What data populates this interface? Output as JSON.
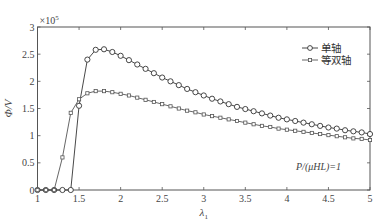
{
  "chart_data": {
    "type": "line",
    "title": "",
    "xlabel": "λ1",
    "ylabel": "Φ/V",
    "y_multiplier": "×10^5",
    "xlim": [
      1,
      5
    ],
    "ylim": [
      0,
      3
    ],
    "xticks": [
      1,
      1.5,
      2,
      2.5,
      3,
      3.5,
      4,
      4.5,
      5
    ],
    "yticks": [
      0,
      0.5,
      1,
      1.5,
      2,
      2.5,
      3
    ],
    "grid": false,
    "legend_position": "upper right",
    "annotation": "P/(μHL)=1",
    "x": [
      1.0,
      1.1,
      1.2,
      1.3,
      1.4,
      1.5,
      1.6,
      1.7,
      1.8,
      1.9,
      2.0,
      2.1,
      2.2,
      2.3,
      2.4,
      2.5,
      2.6,
      2.7,
      2.8,
      2.9,
      3.0,
      3.1,
      3.2,
      3.3,
      3.4,
      3.5,
      3.6,
      3.7,
      3.8,
      3.9,
      4.0,
      4.1,
      4.2,
      4.3,
      4.4,
      4.5,
      4.6,
      4.7,
      4.8,
      4.9,
      5.0
    ],
    "series": [
      {
        "name": "单轴",
        "marker": "circle",
        "values": [
          0,
          0,
          0,
          0,
          0,
          1.55,
          2.4,
          2.58,
          2.59,
          2.54,
          2.47,
          2.39,
          2.31,
          2.23,
          2.15,
          2.07,
          2.0,
          1.93,
          1.86,
          1.8,
          1.74,
          1.68,
          1.63,
          1.58,
          1.53,
          1.49,
          1.45,
          1.41,
          1.37,
          1.33,
          1.3,
          1.27,
          1.24,
          1.21,
          1.18,
          1.15,
          1.13,
          1.1,
          1.08,
          1.06,
          1.03
        ]
      },
      {
        "name": "等双轴",
        "marker": "square",
        "values": [
          0,
          0,
          0,
          0.6,
          1.42,
          1.67,
          1.78,
          1.82,
          1.82,
          1.8,
          1.77,
          1.74,
          1.7,
          1.66,
          1.62,
          1.58,
          1.54,
          1.5,
          1.46,
          1.43,
          1.39,
          1.36,
          1.33,
          1.3,
          1.27,
          1.24,
          1.21,
          1.18,
          1.16,
          1.13,
          1.11,
          1.09,
          1.07,
          1.05,
          1.03,
          1.01,
          0.99,
          0.97,
          0.95,
          0.94,
          0.92
        ]
      }
    ]
  }
}
